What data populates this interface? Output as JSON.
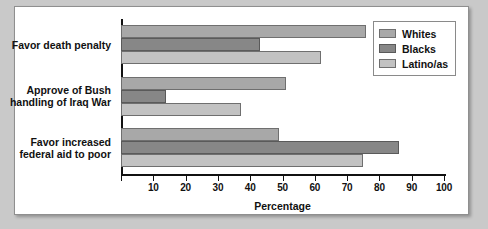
{
  "chart_data": {
    "type": "bar",
    "orientation": "horizontal",
    "title": "",
    "xlabel": "Percentage",
    "ylabel": "",
    "xlim": [
      0,
      100
    ],
    "xticks": [
      0,
      10,
      20,
      30,
      40,
      50,
      60,
      70,
      80,
      90,
      100
    ],
    "xticklabels": [
      "",
      "10",
      "20",
      "30",
      "40",
      "50",
      "60",
      "70",
      "80",
      "90",
      "100"
    ],
    "grid": false,
    "legend_position": "top-right",
    "categories": [
      "Favor death penalty",
      "Approve of Bush handling of Iraq War",
      "Favor increased federal aid to poor"
    ],
    "category_lines": [
      [
        "Favor death penalty"
      ],
      [
        "Approve of Bush",
        "handling of Iraq War"
      ],
      [
        "Favor increased",
        "federal aid to poor"
      ]
    ],
    "series": [
      {
        "name": "Whites",
        "color": "#a8a8a8",
        "values": [
          76,
          51,
          49
        ]
      },
      {
        "name": "Blacks",
        "color": "#878787",
        "values": [
          43,
          14,
          86
        ]
      },
      {
        "name": "Latino/as",
        "color": "#c2c2c2",
        "values": [
          62,
          37,
          75
        ]
      }
    ]
  },
  "legend": {
    "items": [
      {
        "label": "Whites"
      },
      {
        "label": "Blacks"
      },
      {
        "label": "Latino/as"
      }
    ]
  },
  "axis": {
    "x_title": "Percentage"
  }
}
